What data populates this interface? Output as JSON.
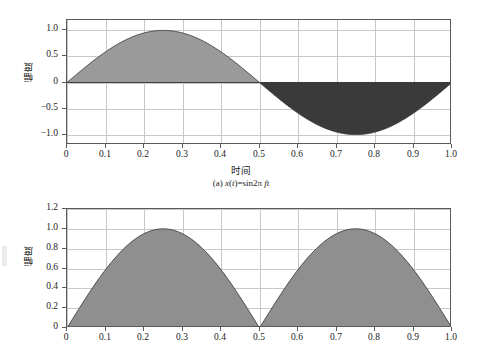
{
  "figure": {
    "caption_a": "(a) x(t)=sin2π ft",
    "caption_a_parts": {
      "prefix": "(a) ",
      "x": "x",
      "open": "(",
      "t": "t",
      "close": ")",
      "eq": "=sin2",
      "pi": "π",
      "space": " ",
      "f": "f",
      "t2": "t"
    }
  },
  "chart_data": [
    {
      "type": "area",
      "id": "sine-signal",
      "title": "(a) x(t)=sin2π ft",
      "xlabel": "时间",
      "ylabel": "幅度",
      "xlim": [
        0,
        1
      ],
      "ylim": [
        -1.2,
        1.2
      ],
      "grid": true,
      "legend": "none",
      "xticks": [
        "0",
        "0.1",
        "0.2",
        "0.3",
        "0.4",
        "0.5",
        "0.6",
        "0.7",
        "0.8",
        "0.9",
        "1.0"
      ],
      "xtickvalues": [
        0,
        0.1,
        0.2,
        0.3,
        0.4,
        0.5,
        0.6,
        0.7,
        0.8,
        0.9,
        1.0
      ],
      "yticks": [
        "-1.0",
        "-0.5",
        "0",
        "0.5",
        "1.0"
      ],
      "ytickvalues": [
        -1.0,
        -0.5,
        0,
        0.5,
        1.0
      ],
      "series": [
        {
          "name": "x(t)=sin2πft",
          "formula": "sin(2*pi*t)",
          "fill_positive": "#9a9a9a",
          "fill_negative": "#3a3a3a",
          "line_color": "#404040",
          "x": [
            0,
            0.05,
            0.1,
            0.15,
            0.2,
            0.25,
            0.3,
            0.35,
            0.4,
            0.45,
            0.5,
            0.55,
            0.6,
            0.65,
            0.7,
            0.75,
            0.8,
            0.85,
            0.9,
            0.95,
            1.0
          ],
          "values": [
            0,
            0.309,
            0.588,
            0.809,
            0.951,
            1.0,
            0.951,
            0.809,
            0.588,
            0.309,
            0,
            -0.309,
            -0.588,
            -0.809,
            -0.951,
            -1.0,
            -0.951,
            -0.809,
            -0.588,
            -0.309,
            0
          ]
        }
      ]
    },
    {
      "type": "area",
      "id": "rectified-sine-signal",
      "title": "",
      "xlabel": "",
      "ylabel": "幅度",
      "xlim": [
        0,
        1
      ],
      "ylim": [
        0,
        1.2
      ],
      "grid": true,
      "legend": "none",
      "xticks": [
        "0",
        "0.1",
        "0.2",
        "0.3",
        "0.4",
        "0.5",
        "0.6",
        "0.7",
        "0.8",
        "0.9",
        "1.0"
      ],
      "xtickvalues": [
        0,
        0.1,
        0.2,
        0.3,
        0.4,
        0.5,
        0.6,
        0.7,
        0.8,
        0.9,
        1.0
      ],
      "yticks": [
        "0",
        "0.2",
        "0.4",
        "0.6",
        "0.8",
        "1.0",
        "1.2"
      ],
      "ytickvalues": [
        0,
        0.2,
        0.4,
        0.6,
        0.8,
        1.0,
        1.2
      ],
      "series": [
        {
          "name": "|x(t)|=|sin2πft|",
          "formula": "abs(sin(2*pi*t))",
          "fill_positive": "#8f8f8f",
          "line_color": "#404040",
          "x": [
            0,
            0.05,
            0.1,
            0.15,
            0.2,
            0.25,
            0.3,
            0.35,
            0.4,
            0.45,
            0.5,
            0.55,
            0.6,
            0.65,
            0.7,
            0.75,
            0.8,
            0.85,
            0.9,
            0.95,
            1.0
          ],
          "values": [
            0,
            0.309,
            0.588,
            0.809,
            0.951,
            1.0,
            0.951,
            0.809,
            0.588,
            0.309,
            0,
            0.309,
            0.588,
            0.809,
            0.951,
            1.0,
            0.951,
            0.809,
            0.588,
            0.309,
            0
          ]
        }
      ]
    }
  ]
}
